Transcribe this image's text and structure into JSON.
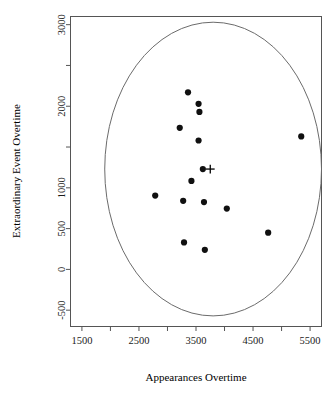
{
  "chart_data": {
    "type": "scatter",
    "title": "",
    "xlabel": "Appearances Overtime",
    "ylabel": "Extraordinary Event Overtime",
    "xlim": [
      1300,
      5700
    ],
    "ylim": [
      -700,
      3100
    ],
    "grid": false,
    "legend": null,
    "xticks": [
      1500,
      2000,
      2500,
      3000,
      3500,
      4000,
      4500,
      5000,
      5500
    ],
    "xticklabels": [
      "1500",
      "",
      "2500",
      "",
      "3500",
      "",
      "4500",
      "",
      "5500"
    ],
    "yticks": [
      -500,
      0,
      500,
      1000,
      1500,
      2000,
      2500,
      3000
    ],
    "yticklabels": [
      "-500",
      "0",
      "500",
      "1000",
      "",
      "2000",
      "",
      "3000"
    ],
    "points": [
      {
        "x": 3360,
        "y": 2170
      },
      {
        "x": 3545,
        "y": 2030
      },
      {
        "x": 3560,
        "y": 1930
      },
      {
        "x": 3215,
        "y": 1735
      },
      {
        "x": 5345,
        "y": 1630
      },
      {
        "x": 3545,
        "y": 1580
      },
      {
        "x": 3620,
        "y": 1230
      },
      {
        "x": 3420,
        "y": 1085
      },
      {
        "x": 2785,
        "y": 905
      },
      {
        "x": 3275,
        "y": 840
      },
      {
        "x": 3640,
        "y": 825
      },
      {
        "x": 4040,
        "y": 745
      },
      {
        "x": 4765,
        "y": 450
      },
      {
        "x": 3290,
        "y": 330
      },
      {
        "x": 3655,
        "y": 240
      }
    ],
    "centroid": {
      "x": 3750,
      "y": 1230,
      "marker": "plus"
    },
    "ellipse": {
      "center_x": 3800,
      "center_y": 1230,
      "semi_axis_x": 1900,
      "semi_axis_y": 1800,
      "note": "confidence ellipse"
    },
    "marker_color": "#101010",
    "ellipse_color": "#6b6b6b",
    "axis_color": "#555555"
  }
}
